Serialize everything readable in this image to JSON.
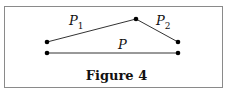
{
  "figure": {
    "caption": "Figure 4",
    "labels": {
      "p1_main": "P",
      "p1_sub": "1",
      "p2_main": "P",
      "p2_sub": "2",
      "p_main": "P"
    },
    "points": {
      "left_upper": [
        47,
        42
      ],
      "left_lower": [
        47,
        53
      ],
      "apex": [
        136,
        19
      ],
      "right_upper": [
        178,
        42
      ],
      "right_lower": [
        178,
        53
      ]
    },
    "colors": {
      "line": "#333333",
      "dot": "#000000",
      "border": "#8a8a8a"
    }
  }
}
